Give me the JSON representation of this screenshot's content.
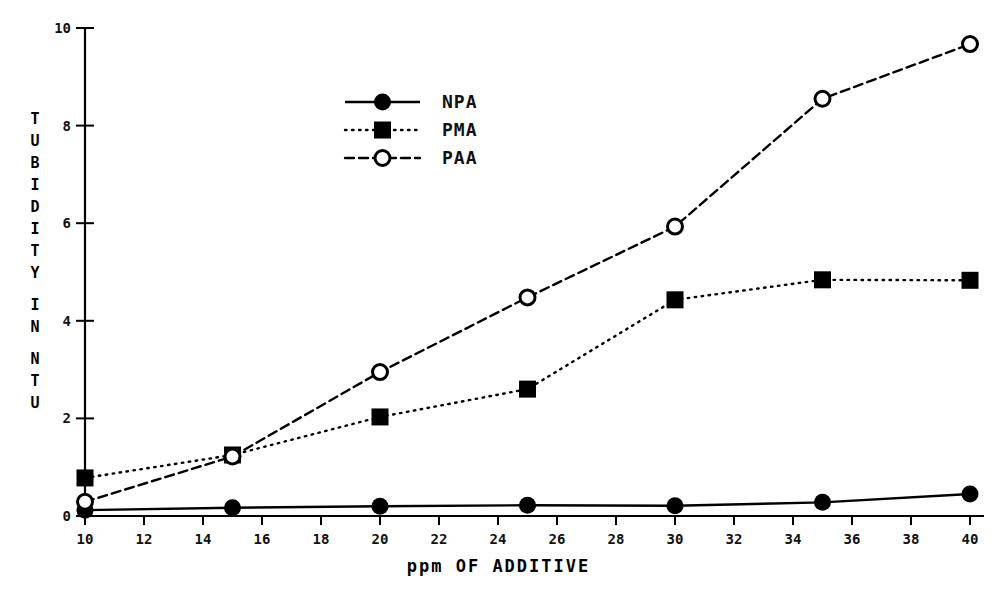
{
  "chart_data": {
    "type": "line",
    "title": "",
    "xlabel": "ppm OF ADDITIVE",
    "ylabel_lines": [
      "TUBIDITY",
      "IN",
      "NTU"
    ],
    "ylabel": "TUBIDITY IN NTU",
    "x": [
      10,
      15,
      20,
      25,
      30,
      35,
      40
    ],
    "xlim": [
      10,
      40
    ],
    "ylim": [
      0,
      10
    ],
    "xticks": [
      10,
      12,
      14,
      16,
      18,
      20,
      22,
      24,
      26,
      28,
      30,
      32,
      34,
      36,
      38,
      40
    ],
    "yticks": [
      0,
      2,
      4,
      6,
      8,
      10
    ],
    "grid": false,
    "legend_position": "upper-center-left",
    "series": [
      {
        "name": "NPA",
        "values": [
          0.12,
          0.17,
          0.2,
          0.22,
          0.21,
          0.28,
          0.45
        ],
        "line_style": "solid",
        "marker": "filled-circle",
        "color": "#000000"
      },
      {
        "name": "PMA",
        "values": [
          0.78,
          1.25,
          2.03,
          2.6,
          4.43,
          4.84,
          4.83
        ],
        "line_style": "dotted",
        "marker": "filled-square",
        "color": "#000000"
      },
      {
        "name": "PAA",
        "values": [
          0.29,
          1.22,
          2.95,
          4.48,
          5.93,
          8.55,
          9.67
        ],
        "line_style": "dashed",
        "marker": "open-circle",
        "color": "#000000"
      }
    ]
  },
  "axis": {
    "x_tick_labels": [
      "10",
      "12",
      "14",
      "16",
      "18",
      "20",
      "22",
      "24",
      "26",
      "28",
      "30",
      "32",
      "34",
      "36",
      "38",
      "40"
    ],
    "y_tick_labels": [
      "0",
      "2",
      "4",
      "6",
      "8",
      "10"
    ]
  },
  "legend": {
    "entries": [
      {
        "label": "NPA"
      },
      {
        "label": "PMA"
      },
      {
        "label": "PAA"
      }
    ]
  },
  "colors": {
    "ink": "#000000",
    "background": "#ffffff"
  }
}
